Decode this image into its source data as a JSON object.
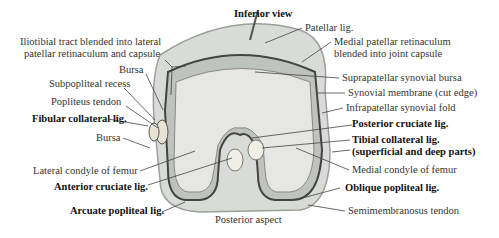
{
  "title": "Inferior view",
  "footer": "Posterior aspect",
  "labels_left": [
    {
      "text": "Iliotibial tract blended into lateral",
      "bold": false
    },
    {
      "text": "patellar retinaculum and capsule",
      "bold": false
    },
    {
      "text": "Bursa",
      "bold": false
    },
    {
      "text": "Subpopliteal recess",
      "bold": false
    },
    {
      "text": "Popliteus tendon",
      "bold": false
    },
    {
      "text": "Fibular collateral lig.",
      "bold": true
    },
    {
      "text": "Bursa",
      "bold": false
    },
    {
      "text": "Lateral condyle of femur",
      "bold": false
    },
    {
      "text": "Anterior cruciate lig.",
      "bold": true
    },
    {
      "text": "Arcuate popliteal lig.",
      "bold": true
    }
  ],
  "labels_right": [
    {
      "text": "Patellar lig.",
      "bold": false
    },
    {
      "text": "Medial patellar retinaculum",
      "bold": false
    },
    {
      "text": "blended into joint capsule",
      "bold": false
    },
    {
      "text": "Suprapatellar synovial bursa",
      "bold": false
    },
    {
      "text": "Synovial membrane (cut edge)",
      "bold": false
    },
    {
      "text": "Infrapatellar synovial fold",
      "bold": false
    },
    {
      "text": "Posterior cruciate lig.",
      "bold": true
    },
    {
      "text": "Tibial collateral lig.",
      "bold": true
    },
    {
      "text": "(superficial and deep parts)",
      "bold": true
    },
    {
      "text": "Medial condyle of femur",
      "bold": false
    },
    {
      "text": "Oblique popliteal lig.",
      "bold": true
    },
    {
      "text": "Semimembranosus tendon",
      "bold": false
    }
  ]
}
